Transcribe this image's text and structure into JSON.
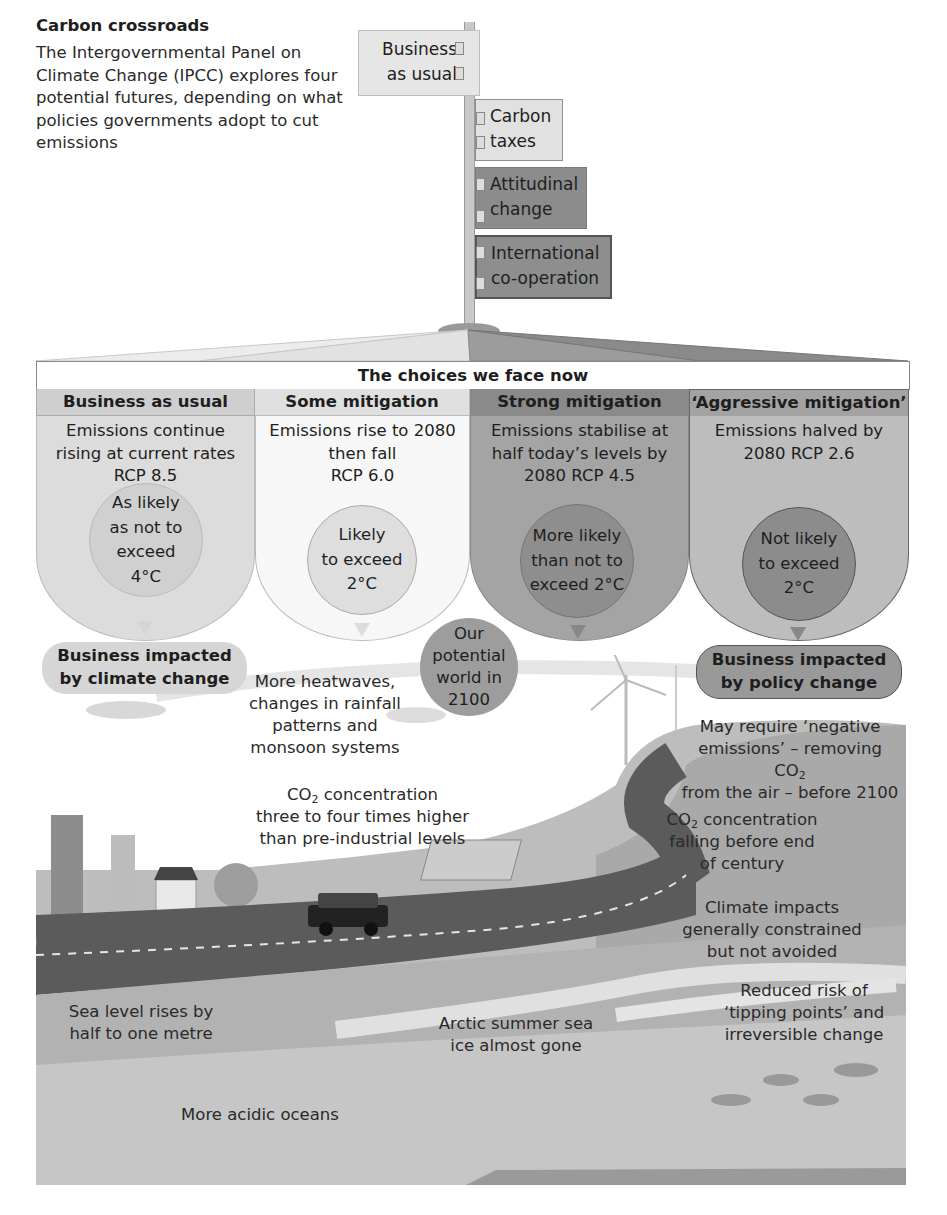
{
  "header": {
    "title": "Carbon crossroads",
    "intro": "The Intergovernmental Panel on Climate Change (IPCC) explores four potential futures, depending on what policies governments adopt to cut emissions"
  },
  "signpost": {
    "signs": [
      {
        "line1": "Business",
        "line2": "as usual"
      },
      {
        "line1": "Carbon",
        "line2": "taxes"
      },
      {
        "line1": "Attitudinal",
        "line2": "change"
      },
      {
        "line1": "International",
        "line2": "co-operation"
      }
    ]
  },
  "panel": {
    "title": "The choices we face now",
    "columns": [
      {
        "heading": "Business as usual",
        "description": [
          "Emissions continue",
          "rising at current rates",
          "RCP 8.5"
        ],
        "likelihood": [
          "As likely",
          "as not to",
          "exceed",
          "4°C"
        ]
      },
      {
        "heading": "Some mitigation",
        "description": [
          "Emissions rise to 2080",
          "then fall",
          "RCP 6.0"
        ],
        "likelihood": [
          "Likely",
          "to exceed",
          "2°C"
        ]
      },
      {
        "heading": "Strong mitigation",
        "description": [
          "Emissions stabilise at",
          "half today’s levels by",
          "2080 RCP 4.5"
        ],
        "likelihood": [
          "More likely",
          "than not to",
          "exceed 2°C"
        ]
      },
      {
        "heading": "‘Aggressive mitigation’",
        "description": [
          "Emissions halved by",
          "2080 RCP 2.6"
        ],
        "likelihood": [
          "Not likely",
          "to exceed",
          "2°C"
        ]
      }
    ]
  },
  "outcomes": {
    "climate_pill": [
      "Business impacted",
      "by climate change"
    ],
    "policy_pill": [
      "Business impacted",
      "by policy change"
    ],
    "world_2100": [
      "Our",
      "potential",
      "world in",
      "2100"
    ]
  },
  "landscape": {
    "heatwaves": [
      "More heatwaves,",
      "changes in rainfall",
      "patterns and",
      "monsoon systems"
    ],
    "co2_high": {
      "prefix": "CO",
      "sub": "2",
      "suffix": " concentration",
      "line2": "three to four times higher",
      "line3": "than pre-industrial levels"
    },
    "negative_emissions": {
      "line1": "May require ‘negative",
      "line2_prefix": "emissions’ – removing CO",
      "line2_sub": "2",
      "line3": "from the air – before 2100"
    },
    "co2_falling": {
      "prefix": "CO",
      "sub": "2",
      "suffix": " concentration",
      "line2": "falling before end",
      "line3": "of century"
    },
    "climate_impacts": [
      "Climate impacts",
      "generally constrained",
      "but not avoided"
    ],
    "tipping_points": [
      "Reduced risk of",
      "‘tipping points’ and",
      "irreversible change"
    ],
    "sea_level": [
      "Sea level rises by",
      "half to one metre"
    ],
    "arctic": [
      "Arctic summer sea",
      "ice almost gone"
    ],
    "acidic": "More acidic oceans"
  },
  "colors": {
    "col1_bg": "#dcdcdc",
    "col2_bg": "#f7f7f7",
    "col3_bg": "#9e9e9e",
    "col4_bg": "#bdbdbd",
    "head1": "#cfcfcf",
    "head2": "#e0e0e0",
    "head3": "#8a8a8a",
    "head4": "#a3a3a3",
    "road": "#5b5b5b",
    "ground": "#a8a8a8",
    "sea_top": "#b5b5b5",
    "sea_bottom": "#c8c8c8"
  }
}
